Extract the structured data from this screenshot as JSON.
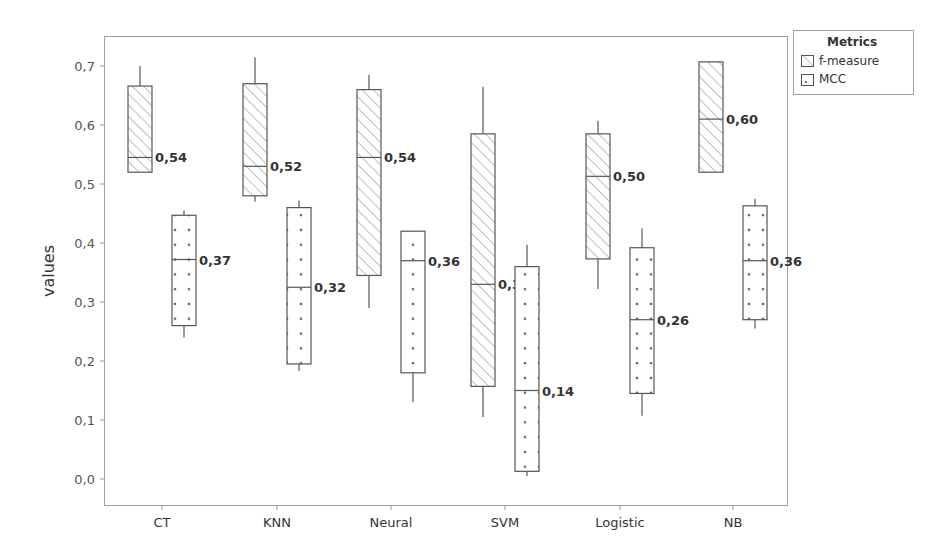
{
  "chart_data": {
    "type": "boxplot",
    "title": "",
    "xlabel": "",
    "ylabel": "values",
    "ylim": [
      -0.045,
      0.745
    ],
    "yticks": [
      0.0,
      0.1,
      0.2,
      0.3,
      0.4,
      0.5,
      0.6,
      0.7
    ],
    "ytick_labels": [
      "0,0",
      "0,1",
      "0,2",
      "0,3",
      "0,4",
      "0,5",
      "0,6",
      "0,7"
    ],
    "grid": false,
    "legend_position": "top-right-outside",
    "legend_title": "Metrics",
    "categories": [
      "CT",
      "KNN",
      "Neural",
      "SVM",
      "Logistic",
      "NB"
    ],
    "series": [
      {
        "name": "f-measure",
        "pattern": "hatched",
        "boxes": [
          {
            "whisker_low": 0.52,
            "q1": 0.52,
            "median": 0.545,
            "q3": 0.666,
            "whisker_high": 0.7,
            "label": "0,54"
          },
          {
            "whisker_low": 0.47,
            "q1": 0.48,
            "median": 0.53,
            "q3": 0.67,
            "whisker_high": 0.715,
            "label": "0,52"
          },
          {
            "whisker_low": 0.29,
            "q1": 0.345,
            "median": 0.545,
            "q3": 0.66,
            "whisker_high": 0.685,
            "label": "0,54"
          },
          {
            "whisker_low": 0.105,
            "q1": 0.157,
            "median": 0.33,
            "q3": 0.585,
            "whisker_high": 0.665,
            "label": "0,32"
          },
          {
            "whisker_low": 0.322,
            "q1": 0.373,
            "median": 0.513,
            "q3": 0.585,
            "whisker_high": 0.607,
            "label": "0,50"
          },
          {
            "whisker_low": 0.52,
            "q1": 0.52,
            "median": 0.61,
            "q3": 0.707,
            "whisker_high": 0.707,
            "label": "0,60"
          }
        ]
      },
      {
        "name": "MCC",
        "pattern": "dotted",
        "boxes": [
          {
            "whisker_low": 0.24,
            "q1": 0.26,
            "median": 0.372,
            "q3": 0.447,
            "whisker_high": 0.455,
            "label": "0,37"
          },
          {
            "whisker_low": 0.183,
            "q1": 0.195,
            "median": 0.325,
            "q3": 0.46,
            "whisker_high": 0.472,
            "label": "0,32"
          },
          {
            "whisker_low": 0.13,
            "q1": 0.18,
            "median": 0.37,
            "q3": 0.42,
            "whisker_high": 0.42,
            "label": "0,36"
          },
          {
            "whisker_low": 0.005,
            "q1": 0.013,
            "median": 0.15,
            "q3": 0.36,
            "whisker_high": 0.397,
            "label": "0,14"
          },
          {
            "whisker_low": 0.107,
            "q1": 0.145,
            "median": 0.27,
            "q3": 0.392,
            "whisker_high": 0.425,
            "label": "0,26"
          },
          {
            "whisker_low": 0.255,
            "q1": 0.27,
            "median": 0.37,
            "q3": 0.463,
            "whisker_high": 0.475,
            "label": "0,36"
          }
        ]
      }
    ]
  },
  "colors": {
    "frame": "#9a9a9a",
    "box_stroke": "#555555",
    "hatch": "#777777",
    "dot": "#666666",
    "text": "#333333"
  }
}
